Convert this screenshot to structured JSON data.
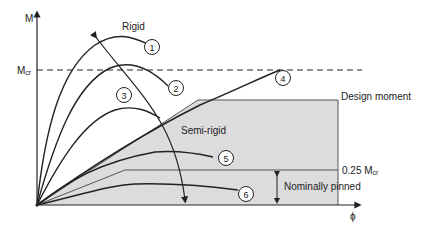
{
  "figure": {
    "axes": {
      "y_label": "M",
      "x_label": "ϕ",
      "mcr_label": "M",
      "mcr_sub": "cr"
    },
    "labels": {
      "rigid": "Rigid",
      "semi_rigid": "Semi-rigid",
      "design_moment": "Design moment",
      "quarter_mcr": "0.25 M",
      "quarter_mcr_sub": "cr",
      "nominally_pinned": "Nominally pinned"
    },
    "curves": [
      {
        "id": "1",
        "label": "1"
      },
      {
        "id": "2",
        "label": "2"
      },
      {
        "id": "3",
        "label": "3"
      },
      {
        "id": "4",
        "label": "4"
      },
      {
        "id": "5",
        "label": "5"
      },
      {
        "id": "6",
        "label": "6"
      }
    ],
    "colors": {
      "line": "#222222",
      "shade": "#dcdcdc",
      "background": "#ffffff"
    }
  }
}
